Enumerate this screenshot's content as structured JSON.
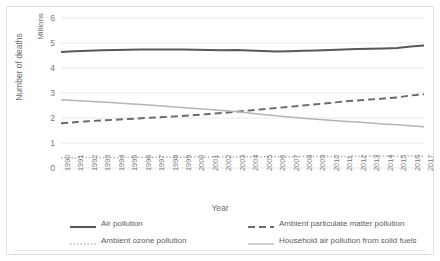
{
  "chart_data": {
    "type": "line",
    "title": "",
    "xlabel": "Year",
    "ylabel": "Number of deaths",
    "y_units": "Millions",
    "ylim": [
      0,
      6
    ],
    "yticks": [
      0,
      1,
      2,
      3,
      4,
      5,
      6
    ],
    "grid": "horizontal",
    "legend_position": "bottom",
    "x": [
      1990,
      1991,
      1992,
      1993,
      1994,
      1995,
      1996,
      1997,
      1998,
      1999,
      2000,
      2001,
      2002,
      2003,
      2004,
      2005,
      2006,
      2007,
      2008,
      2009,
      2010,
      2011,
      2012,
      2013,
      2014,
      2015,
      2016,
      2017
    ],
    "series": [
      {
        "name": "Air pollution",
        "style": "solid-thick",
        "color": "#585858",
        "values": [
          4.64,
          4.67,
          4.69,
          4.71,
          4.72,
          4.73,
          4.74,
          4.74,
          4.74,
          4.74,
          4.73,
          4.72,
          4.71,
          4.72,
          4.7,
          4.68,
          4.66,
          4.67,
          4.69,
          4.7,
          4.72,
          4.74,
          4.76,
          4.77,
          4.78,
          4.8,
          4.86,
          4.9
        ]
      },
      {
        "name": "Ambient particulate matter pollution",
        "style": "dashed",
        "color": "#6a6a6a",
        "values": [
          1.79,
          1.83,
          1.87,
          1.9,
          1.93,
          1.96,
          1.99,
          2.02,
          2.05,
          2.08,
          2.12,
          2.16,
          2.2,
          2.25,
          2.3,
          2.35,
          2.4,
          2.45,
          2.5,
          2.55,
          2.6,
          2.66,
          2.7,
          2.74,
          2.78,
          2.82,
          2.9,
          2.95
        ]
      },
      {
        "name": "Ambient ozone pollution",
        "style": "dotted",
        "color": "#a8a8a8",
        "values": [
          0.41,
          0.41,
          0.42,
          0.42,
          0.42,
          0.42,
          0.43,
          0.43,
          0.43,
          0.43,
          0.44,
          0.44,
          0.44,
          0.44,
          0.45,
          0.45,
          0.45,
          0.45,
          0.46,
          0.46,
          0.46,
          0.46,
          0.47,
          0.47,
          0.47,
          0.47,
          0.48,
          0.48
        ]
      },
      {
        "name": "Household air pollution from solid fuels",
        "style": "solid-thin",
        "color": "#b4b4b4",
        "values": [
          2.73,
          2.7,
          2.67,
          2.64,
          2.61,
          2.57,
          2.54,
          2.5,
          2.46,
          2.42,
          2.38,
          2.34,
          2.3,
          2.26,
          2.2,
          2.14,
          2.09,
          2.04,
          1.99,
          1.95,
          1.91,
          1.87,
          1.84,
          1.8,
          1.76,
          1.73,
          1.69,
          1.65
        ]
      }
    ]
  },
  "legend": {
    "items": [
      {
        "label": "Air pollution"
      },
      {
        "label": "Ambient particulate matter pollution"
      },
      {
        "label": "Ambient ozone pollution"
      },
      {
        "label": "Household air pollution from solid fuels"
      }
    ]
  },
  "colors": {
    "air_pollution": "#585858",
    "ambient_particulate": "#6a6a6a",
    "ambient_ozone": "#a8a8a8",
    "household": "#b4b4b4",
    "gridline": "#e9e9e9",
    "frame": "#e2e2e2",
    "tick_text": "#7a7a7a"
  }
}
